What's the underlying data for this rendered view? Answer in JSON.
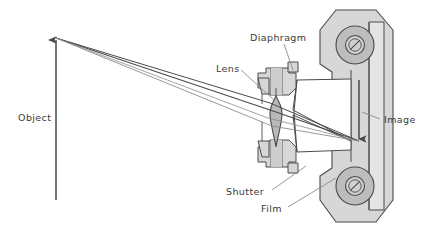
{
  "figure": {
    "type": "technical-line-diagram",
    "canvas": {
      "width": 427,
      "height": 233
    },
    "background_color": "#ffffff"
  },
  "labels": {
    "object": "Object",
    "lens": "Lens",
    "diaphragm": "Diaphragm",
    "shutter": "Shutter",
    "film": "Film",
    "image": "Image"
  },
  "colors": {
    "stroke": "#4a4a4a",
    "text": "#3a3a3a",
    "body_fill": "#d7d7d7",
    "body_fill_light": "#e4e4e4",
    "roller_outer": "#bdbdbd",
    "roller_inner": "#d0d0d0",
    "lens_fill": "#b9b9b9",
    "leader_line": "#8c8c8c",
    "ray": "#4a4a4a",
    "arrow": "#4a4a4a"
  },
  "elements": {
    "object_arrow": {
      "name": "object-arrow",
      "description": "Upward vertical arrow at left representing the object",
      "x": 56,
      "y_tail": 200,
      "y_head": 38,
      "direction": "up"
    },
    "image_arrow": {
      "name": "image-arrow",
      "description": "Downward vertical arrow at film plane representing the inverted image",
      "x": 359,
      "y_tail": 80,
      "y_head": 141,
      "direction": "down"
    },
    "rays": {
      "name": "light-rays",
      "description": "Ray bundle from object tip through lens converging to image tip",
      "object_tip": [
        56,
        38
      ],
      "image_tip": [
        359,
        141
      ],
      "lens_center": [
        277,
        112
      ]
    },
    "camera_body": {
      "name": "camera-body",
      "description": "Vertical film-back housing with two film rollers",
      "rollers": [
        {
          "cx": 355,
          "cy": 45,
          "r_outer": 19,
          "r_inner": 9
        },
        {
          "cx": 355,
          "cy": 186,
          "r_outer": 19,
          "r_inner": 9
        }
      ]
    },
    "lens_assembly": {
      "name": "lens-assembly",
      "description": "Biconvex lens with upper and lower barrel / diaphragm blocks"
    }
  },
  "leaders": [
    {
      "name": "diaphragm-leader",
      "from": [
        283,
        44
      ],
      "to": [
        293,
        72
      ]
    },
    {
      "name": "lens-leader",
      "from": [
        240,
        70
      ],
      "to": [
        276,
        100
      ]
    },
    {
      "name": "shutter-leader",
      "from": [
        270,
        190
      ],
      "to": [
        300,
        168
      ]
    },
    {
      "name": "film-leader",
      "from": [
        288,
        208
      ],
      "to": [
        330,
        182
      ]
    },
    {
      "name": "image-leader",
      "from": [
        380,
        118
      ],
      "to": [
        363,
        112
      ]
    }
  ]
}
